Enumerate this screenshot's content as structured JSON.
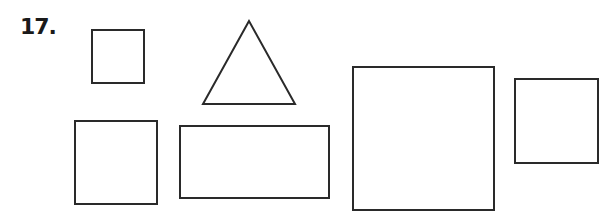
{
  "problem": {
    "number_label": "17.",
    "stroke_color": "#2a2a2a",
    "shapes": [
      {
        "kind": "square",
        "name": "small-square-top",
        "x": 92,
        "y": 30,
        "w": 52,
        "h": 53
      },
      {
        "kind": "triangle",
        "name": "triangle",
        "points": "249,21 203,104 295,104"
      },
      {
        "kind": "square",
        "name": "square-bottom-left",
        "x": 75,
        "y": 121,
        "w": 82,
        "h": 83
      },
      {
        "kind": "rectangle",
        "name": "wide-rectangle",
        "x": 180,
        "y": 126,
        "w": 149,
        "h": 72
      },
      {
        "kind": "square",
        "name": "large-square",
        "x": 353,
        "y": 67,
        "w": 141,
        "h": 143
      },
      {
        "kind": "square",
        "name": "square-right",
        "x": 515,
        "y": 79,
        "w": 83,
        "h": 84
      }
    ]
  }
}
